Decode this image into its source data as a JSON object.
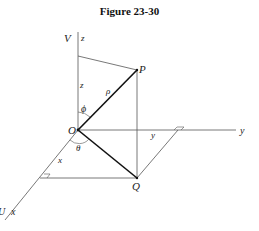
{
  "title": "Figure 23-30",
  "labels": {
    "V": "V",
    "z_axis": "z",
    "z_len": "z",
    "P": "P",
    "rho": "ρ",
    "phi": "ϕ",
    "O": "O",
    "theta": "θ",
    "y_len": "y",
    "y_axis": "y",
    "x_len": "x",
    "Q": "Q",
    "U": "U",
    "x_axis": "x"
  },
  "colors": {
    "line": "#555555",
    "bold_line": "#111111",
    "text": "#222222"
  }
}
